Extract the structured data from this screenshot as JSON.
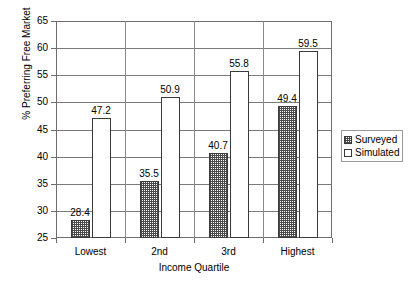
{
  "chart_data": {
    "type": "bar",
    "title": "",
    "xlabel": "Income Quartile",
    "ylabel": "% Preferring Free Market",
    "categories": [
      "Lowest",
      "2nd",
      "3rd",
      "Highest"
    ],
    "series": [
      {
        "name": "Surveyed",
        "values": [
          28.4,
          35.5,
          40.7,
          49.4
        ]
      },
      {
        "name": "Simulated",
        "values": [
          47.2,
          50.9,
          55.8,
          59.5
        ]
      }
    ],
    "ylim": [
      25,
      65
    ],
    "yticks": [
      25,
      30,
      35,
      40,
      45,
      50,
      55,
      60,
      65
    ],
    "ytick_labels": [
      "25",
      "30",
      "35",
      "40",
      "45",
      "50",
      "55",
      "60",
      "65"
    ],
    "grid": "horizontal",
    "legend_position": "right",
    "data_labels": [
      "28.4",
      "47.2",
      "35.5",
      "50.9",
      "40.7",
      "55.8",
      "49.4",
      "59.5"
    ],
    "colors": {
      "surveyed_fill": "#4a4a4a",
      "simulated_fill": "#ffffff",
      "bar_outline": "#3a3a3a",
      "gridline": "#7a7a7a",
      "axis": "#6e6e6e",
      "text": "#000000",
      "background": "#ffffff"
    }
  },
  "legend": {
    "items": [
      {
        "label": "Surveyed"
      },
      {
        "label": "Simulated"
      }
    ]
  }
}
